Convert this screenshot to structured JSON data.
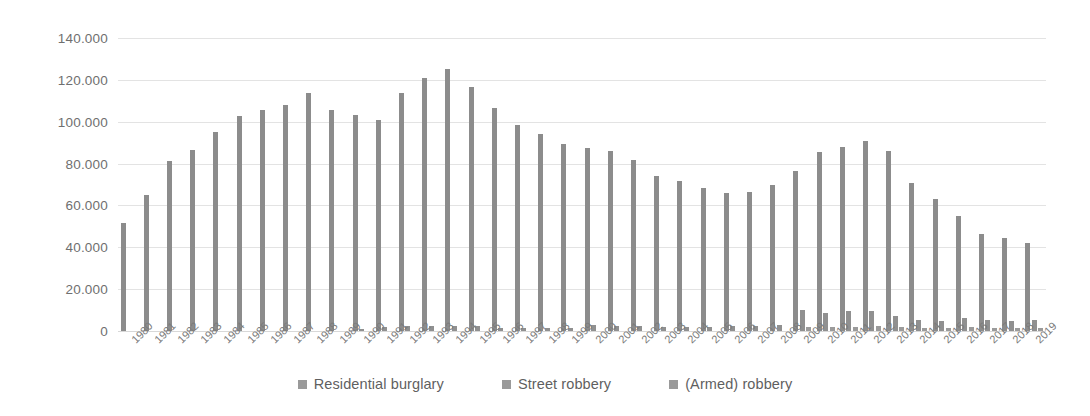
{
  "chart_data": {
    "type": "bar",
    "title": "",
    "subtitle": "",
    "xlabel": "",
    "ylabel": "",
    "ylim": [
      0,
      140000
    ],
    "grid": true,
    "legend_position": "bottom",
    "y_ticks": [
      0,
      20000,
      40000,
      60000,
      80000,
      100000,
      120000,
      140000
    ],
    "y_tick_labels": [
      "0",
      "20.000",
      "40.000",
      "60.000",
      "80.000",
      "100.000",
      "120.000",
      "140.000"
    ],
    "categories": [
      "1980",
      "1981",
      "1982",
      "1983",
      "1984",
      "1985",
      "1986",
      "1987",
      "1988",
      "1989",
      "1990",
      "1991",
      "1992",
      "1993",
      "1994",
      "1995",
      "1996",
      "1997",
      "1998",
      "1999",
      "2000",
      "2001",
      "2002",
      "2003",
      "2004",
      "2005",
      "2006",
      "2007",
      "2008",
      "2009",
      "2010",
      "2011",
      "2012",
      "2013",
      "2014",
      "2015",
      "2016",
      "2017",
      "2018",
      "2019"
    ],
    "series": [
      {
        "name": "Residential burglary",
        "color": "#8c8c8c",
        "values": [
          51500,
          65000,
          81000,
          86500,
          95000,
          102500,
          105500,
          108000,
          113500,
          105500,
          103000,
          101000,
          113500,
          121000,
          125000,
          116500,
          106500,
          98500,
          94000,
          89500,
          87500,
          86000,
          81500,
          74000,
          71500,
          68500,
          66000,
          66500,
          70000,
          76500,
          85500,
          88000,
          91000,
          86000,
          70500,
          63000,
          55000,
          46500,
          44500,
          42000
        ]
      },
      {
        "name": "Street robbery",
        "color": "#909090",
        "values": [
          0,
          0,
          0,
          0,
          0,
          0,
          0,
          0,
          0,
          0,
          1200,
          1800,
          2300,
          2600,
          2600,
          2200,
          1600,
          1300,
          1300,
          1500,
          2700,
          2600,
          2400,
          1900,
          1800,
          1900,
          2400,
          2400,
          3000,
          10000,
          8800,
          9700,
          9500,
          7200,
          5100,
          4800,
          6000,
          5200,
          5000,
          5500
        ]
      },
      {
        "name": "(Armed) robbery",
        "color": "#9b9b9b",
        "values": [
          0,
          0,
          0,
          0,
          0,
          0,
          0,
          0,
          0,
          0,
          0,
          0,
          0,
          0,
          0,
          0,
          0,
          0,
          0,
          0,
          0,
          0,
          0,
          0,
          0,
          0,
          0,
          0,
          0,
          2000,
          1700,
          1800,
          2500,
          2100,
          1600,
          1400,
          1800,
          1600,
          1500,
          1400
        ]
      }
    ]
  },
  "legend": {
    "items": [
      {
        "label": "Residential burglary"
      },
      {
        "label": "Street robbery"
      },
      {
        "label": "(Armed) robbery"
      }
    ]
  }
}
